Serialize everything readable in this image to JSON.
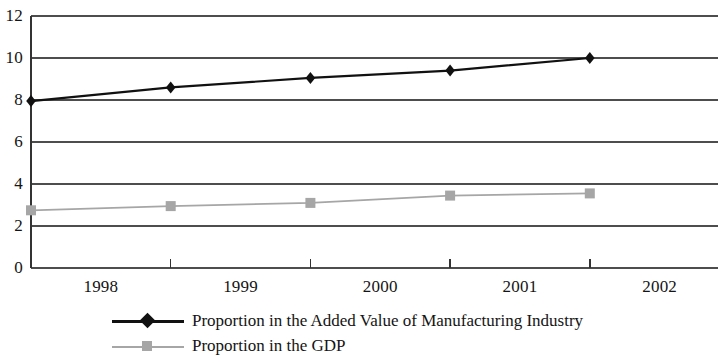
{
  "chart_data": {
    "type": "line",
    "title": "",
    "subtitle": "",
    "xlabel": "",
    "ylabel": "",
    "categories": [
      "1998",
      "1999",
      "2000",
      "2001",
      "2002"
    ],
    "ylim": [
      0,
      12
    ],
    "ytick_values": [
      "12",
      "10",
      "8",
      "6",
      "4",
      "2",
      "0"
    ],
    "grid": true,
    "legend_position": "bottom",
    "series": [
      {
        "name": "Proportion in the Added Value of Manufacturing Industry",
        "color": "#111111",
        "marker": "diamond",
        "values": [
          7.95,
          8.6,
          9.05,
          9.4,
          10.0
        ]
      },
      {
        "name": "Proportion in the GDP",
        "color": "#a6a6a6",
        "marker": "square",
        "values": [
          2.75,
          2.95,
          3.1,
          3.45,
          3.55
        ]
      }
    ]
  },
  "axis": {
    "y_ticks": [
      "12",
      "10",
      "8",
      "6",
      "4",
      "2",
      "0"
    ],
    "x_ticks": [
      "1998",
      "1999",
      "2000",
      "2001",
      "2002"
    ]
  },
  "legend": {
    "items": [
      {
        "label": "Proportion in the Added Value of Manufacturing Industry"
      },
      {
        "label": "Proportion in the GDP"
      }
    ]
  }
}
